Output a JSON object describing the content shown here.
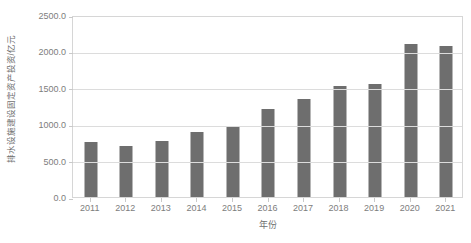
{
  "chart_data": {
    "type": "bar",
    "title": "",
    "subtitle": "",
    "xlabel": "年份",
    "ylabel": "排水设施建设固定资产投资/亿元",
    "categories": [
      "2011",
      "2012",
      "2013",
      "2014",
      "2015",
      "2016",
      "2017",
      "2018",
      "2019",
      "2020",
      "2021"
    ],
    "values": [
      760,
      700,
      775,
      890,
      975,
      1215,
      1345,
      1525,
      1550,
      2105,
      2070
    ],
    "series": [
      {
        "name": "排水设施建设固定资产投资",
        "values": [
          760,
          700,
          775,
          890,
          975,
          1215,
          1345,
          1525,
          1550,
          2105,
          2070
        ]
      }
    ],
    "ylim": [
      0,
      2500
    ],
    "y_ticks": [
      0,
      500,
      1000,
      1500,
      2000,
      2500
    ],
    "y_tick_labels": [
      "0.0",
      "500.0",
      "1000.0",
      "1500.0",
      "2000.0",
      "2500.0"
    ],
    "x_tick_labels": [
      "2011",
      "2012",
      "2013",
      "2014",
      "2015",
      "2016",
      "2017",
      "2018",
      "2019",
      "2020",
      "2021"
    ],
    "grid": true,
    "grid_axis": "y",
    "legend": false,
    "legend_position": "none",
    "annotations": [],
    "colors": {
      "bar": "#6e6e6e",
      "gridline": "#dcdcdc",
      "axis_border": "#d6d6d6",
      "tick_text": "#7d7d7d",
      "axis_title_text": "#6f6f6f",
      "background": "#ffffff"
    }
  }
}
